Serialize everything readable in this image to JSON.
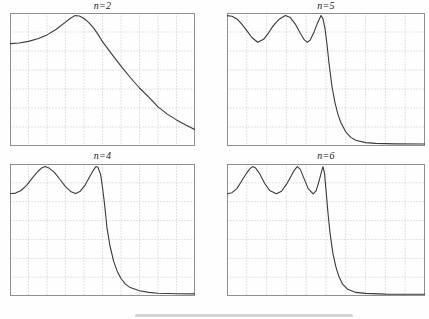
{
  "figure": {
    "kind": "2x2-grid-of-filter-magnitude-plots",
    "grid_cols": 10,
    "grid_rows": 7,
    "colors": {
      "background": "#fefefe",
      "curve": "#3a3a3a",
      "grid": "#c6c6c6",
      "border": "#8f8f8f",
      "title": "#1c1c1c",
      "bottom_bar": "#d4d4d4"
    }
  },
  "chart_data": [
    {
      "type": "line",
      "title": "n=2",
      "n": 2,
      "xlabel": "",
      "ylabel": "",
      "x_range": [
        0,
        2
      ],
      "y_range": [
        0,
        1.02
      ],
      "grid": "dotted",
      "passband_ripple_bottom": 0.79,
      "points": [
        [
          0.0,
          0.785
        ],
        [
          0.1,
          0.79
        ],
        [
          0.2,
          0.802
        ],
        [
          0.3,
          0.822
        ],
        [
          0.4,
          0.852
        ],
        [
          0.5,
          0.895
        ],
        [
          0.6,
          0.95
        ],
        [
          0.65,
          0.978
        ],
        [
          0.7,
          1.0
        ],
        [
          0.75,
          0.997
        ],
        [
          0.8,
          0.978
        ],
        [
          0.85,
          0.948
        ],
        [
          0.9,
          0.908
        ],
        [
          0.95,
          0.858
        ],
        [
          1.0,
          0.8
        ],
        [
          1.1,
          0.705
        ],
        [
          1.2,
          0.612
        ],
        [
          1.3,
          0.525
        ],
        [
          1.4,
          0.445
        ],
        [
          1.5,
          0.375
        ],
        [
          1.6,
          0.3
        ],
        [
          1.7,
          0.245
        ],
        [
          1.8,
          0.2
        ],
        [
          1.9,
          0.16
        ],
        [
          2.0,
          0.125
        ]
      ]
    },
    {
      "type": "line",
      "title": "n=5",
      "n": 5,
      "xlabel": "",
      "ylabel": "",
      "x_range": [
        0,
        2
      ],
      "y_range": [
        0,
        1.02
      ],
      "grid": "dotted",
      "passband_ripple_bottom": 0.79,
      "points": [
        [
          0.0,
          1.0
        ],
        [
          0.05,
          0.995
        ],
        [
          0.1,
          0.975
        ],
        [
          0.15,
          0.935
        ],
        [
          0.2,
          0.885
        ],
        [
          0.25,
          0.832
        ],
        [
          0.31,
          0.795
        ],
        [
          0.37,
          0.818
        ],
        [
          0.42,
          0.868
        ],
        [
          0.47,
          0.925
        ],
        [
          0.53,
          0.975
        ],
        [
          0.59,
          1.0
        ],
        [
          0.64,
          0.985
        ],
        [
          0.69,
          0.935
        ],
        [
          0.74,
          0.865
        ],
        [
          0.78,
          0.815
        ],
        [
          0.81,
          0.795
        ],
        [
          0.84,
          0.812
        ],
        [
          0.88,
          0.875
        ],
        [
          0.91,
          0.935
        ],
        [
          0.95,
          1.0
        ],
        [
          0.97,
          0.975
        ],
        [
          0.99,
          0.9
        ],
        [
          1.01,
          0.78
        ],
        [
          1.03,
          0.635
        ],
        [
          1.06,
          0.46
        ],
        [
          1.09,
          0.335
        ],
        [
          1.12,
          0.245
        ],
        [
          1.15,
          0.18
        ],
        [
          1.2,
          0.107
        ],
        [
          1.25,
          0.066
        ],
        [
          1.3,
          0.044
        ],
        [
          1.4,
          0.026
        ],
        [
          1.5,
          0.02
        ],
        [
          1.7,
          0.016
        ],
        [
          2.0,
          0.015
        ]
      ]
    },
    {
      "type": "line",
      "title": "n=4",
      "n": 4,
      "xlabel": "",
      "ylabel": "",
      "x_range": [
        0,
        2
      ],
      "y_range": [
        0,
        1.02
      ],
      "grid": "dotted",
      "passband_ripple_bottom": 0.79,
      "points": [
        [
          0.0,
          0.79
        ],
        [
          0.06,
          0.795
        ],
        [
          0.12,
          0.815
        ],
        [
          0.18,
          0.855
        ],
        [
          0.24,
          0.91
        ],
        [
          0.3,
          0.962
        ],
        [
          0.34,
          0.988
        ],
        [
          0.38,
          1.0
        ],
        [
          0.42,
          0.99
        ],
        [
          0.48,
          0.955
        ],
        [
          0.54,
          0.9
        ],
        [
          0.6,
          0.845
        ],
        [
          0.66,
          0.805
        ],
        [
          0.71,
          0.792
        ],
        [
          0.76,
          0.81
        ],
        [
          0.81,
          0.855
        ],
        [
          0.86,
          0.92
        ],
        [
          0.9,
          0.972
        ],
        [
          0.93,
          1.0
        ],
        [
          0.95,
          0.995
        ],
        [
          0.98,
          0.94
        ],
        [
          1.0,
          0.84
        ],
        [
          1.02,
          0.72
        ],
        [
          1.05,
          0.52
        ],
        [
          1.08,
          0.39
        ],
        [
          1.12,
          0.27
        ],
        [
          1.16,
          0.19
        ],
        [
          1.2,
          0.135
        ],
        [
          1.25,
          0.09
        ],
        [
          1.3,
          0.065
        ],
        [
          1.4,
          0.04
        ],
        [
          1.5,
          0.028
        ],
        [
          1.6,
          0.022
        ],
        [
          1.8,
          0.017
        ],
        [
          2.0,
          0.016
        ]
      ]
    },
    {
      "type": "line",
      "title": "n=6",
      "n": 6,
      "xlabel": "",
      "ylabel": "",
      "x_range": [
        0,
        2
      ],
      "y_range": [
        0,
        1.02
      ],
      "grid": "dotted",
      "passband_ripple_bottom": 0.79,
      "points": [
        [
          0.0,
          0.79
        ],
        [
          0.05,
          0.798
        ],
        [
          0.1,
          0.83
        ],
        [
          0.15,
          0.89
        ],
        [
          0.2,
          0.952
        ],
        [
          0.23,
          0.982
        ],
        [
          0.26,
          1.0
        ],
        [
          0.29,
          0.988
        ],
        [
          0.33,
          0.944
        ],
        [
          0.38,
          0.872
        ],
        [
          0.43,
          0.815
        ],
        [
          0.5,
          0.79
        ],
        [
          0.55,
          0.81
        ],
        [
          0.6,
          0.862
        ],
        [
          0.65,
          0.93
        ],
        [
          0.68,
          0.972
        ],
        [
          0.71,
          1.0
        ],
        [
          0.74,
          0.978
        ],
        [
          0.78,
          0.905
        ],
        [
          0.82,
          0.83
        ],
        [
          0.87,
          0.79
        ],
        [
          0.9,
          0.812
        ],
        [
          0.93,
          0.89
        ],
        [
          0.96,
          0.975
        ],
        [
          0.97,
          1.0
        ],
        [
          0.985,
          0.95
        ],
        [
          1.0,
          0.82
        ],
        [
          1.02,
          0.64
        ],
        [
          1.04,
          0.49
        ],
        [
          1.07,
          0.33
        ],
        [
          1.1,
          0.225
        ],
        [
          1.13,
          0.15
        ],
        [
          1.17,
          0.09
        ],
        [
          1.22,
          0.052
        ],
        [
          1.3,
          0.028
        ],
        [
          1.4,
          0.02
        ],
        [
          1.6,
          0.015
        ],
        [
          2.0,
          0.014
        ]
      ]
    }
  ],
  "artifacts": {
    "bottom_bar": {
      "color": "#d4d4d4"
    }
  }
}
